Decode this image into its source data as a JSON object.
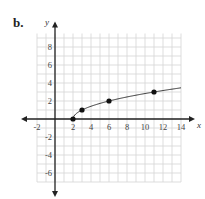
{
  "part_label": "b.",
  "chart_data": {
    "type": "line",
    "title": "",
    "function": "y = sqrt(x - 2)",
    "xlabel": "x",
    "ylabel": "y",
    "xlim": [
      -2,
      14
    ],
    "ylim": [
      -7,
      9.5
    ],
    "grid": true,
    "grid_step": 1,
    "x_ticks": [
      -2,
      2,
      4,
      6,
      8,
      10,
      12,
      14
    ],
    "y_ticks": [
      8,
      6,
      4,
      2,
      -2,
      -4,
      -6
    ],
    "points": [
      {
        "x": 2,
        "y": 0
      },
      {
        "x": 3,
        "y": 1
      },
      {
        "x": 6,
        "y": 2
      },
      {
        "x": 11,
        "y": 3
      }
    ],
    "curve_domain": [
      2,
      14
    ],
    "colors": {
      "grid": "#d4d4d4",
      "axis": "#222222",
      "curve": "#333333",
      "point": "#111111"
    }
  },
  "layout": {
    "origin_px": [
      55,
      119
    ],
    "unit_px": 9
  }
}
